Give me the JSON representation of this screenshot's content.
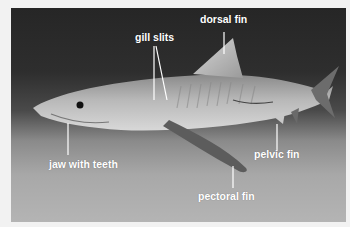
{
  "image": {
    "subject": "tiger shark",
    "colors": {
      "frame": "#f2f2f2",
      "water_top": "#262626",
      "sand": "#b0b0b0",
      "label": "#ffffff"
    }
  },
  "labels": {
    "gill_slits": "gill slits",
    "dorsal_fin": "dorsal fin",
    "jaw_with_teeth": "jaw with teeth",
    "pelvic_fin": "pelvic fin",
    "pectoral_fin": "pectoral fin"
  }
}
